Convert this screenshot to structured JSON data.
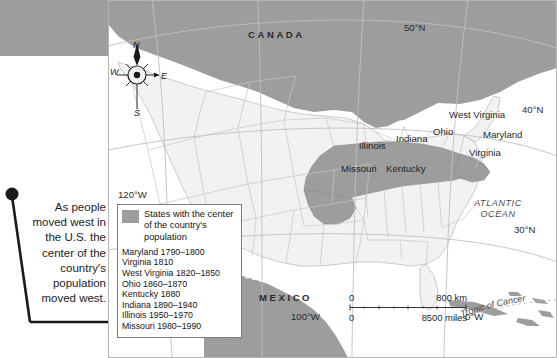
{
  "annotation": {
    "text": "As people moved west in the U.S. the center of the country's population moved west."
  },
  "map": {
    "countries": [
      {
        "name": "canada-label",
        "text": "CANADA"
      },
      {
        "name": "mexico-label",
        "text": "MEXICO"
      }
    ],
    "ocean_label": {
      "line1": "ATLANTIC",
      "line2": "OCEAN"
    },
    "states": [
      {
        "name": "illinois",
        "text": "Illinois"
      },
      {
        "name": "indiana",
        "text": "Indiana"
      },
      {
        "name": "ohio",
        "text": "Ohio"
      },
      {
        "name": "west-virginia",
        "text": "West Virginia"
      },
      {
        "name": "maryland",
        "text": "Maryland"
      },
      {
        "name": "virginia",
        "text": "Virginia"
      },
      {
        "name": "kentucky",
        "text": "Kentucky"
      },
      {
        "name": "missouri",
        "text": "Missouri"
      }
    ],
    "graticule": [
      {
        "name": "lat-50n",
        "text": "50°N"
      },
      {
        "name": "lat-40n",
        "text": "40°N"
      },
      {
        "name": "lat-30n",
        "text": "30°N"
      },
      {
        "name": "lon-120w",
        "text": "120°W"
      },
      {
        "name": "lon-100w",
        "text": "100°W"
      },
      {
        "name": "lon-0w",
        "text": "0°W"
      }
    ],
    "tropic_label": "Tropic of Cancer",
    "compass": {
      "north": "N",
      "south": "S",
      "east": "E",
      "west": "W"
    },
    "colors": {
      "highlight": "#9d9d9d",
      "foreign": "#9d9d9d",
      "states_fill": "#f2f2f2",
      "water": "#ffffff",
      "border": "#b4b4b4"
    }
  },
  "legend": {
    "swatch_caption": "States with the center of the country's population",
    "entries": [
      "Maryland 1790–1800",
      "Virginia 1810",
      "West Virginia 1820–1850",
      "Ohio 1860–1870",
      "Kentucky 1880",
      "Indiana 1890–1940",
      "Illinois 1950–1970",
      "Missouri 1980–1990"
    ]
  },
  "scale": {
    "km_start": "0",
    "km_end": "800 km",
    "miles_start": "0",
    "miles_end": "8500 miles"
  }
}
